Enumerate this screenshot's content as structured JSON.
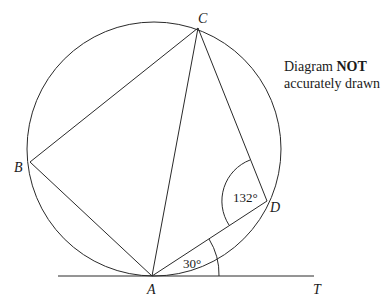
{
  "diagram": {
    "note": {
      "line1_prefix": "Diagram ",
      "line1_bold": "NOT",
      "line2": "accurately drawn"
    },
    "points": {
      "A": {
        "label": "A",
        "x": 152,
        "y": 276
      },
      "B": {
        "label": "B",
        "x": 30,
        "y": 162
      },
      "C": {
        "label": "C",
        "x": 198,
        "y": 28
      },
      "D": {
        "label": "D",
        "x": 267,
        "y": 201
      },
      "T": {
        "label": "T"
      }
    },
    "circle": {
      "cx": 154,
      "cy": 149,
      "r": 127
    },
    "tangent": {
      "label": "AT",
      "x1": 58,
      "x2": 314,
      "y": 276
    },
    "segments": [
      "AB",
      "BC",
      "CA",
      "CD",
      "DA"
    ],
    "angles": {
      "CDA": {
        "value": "132°"
      },
      "DAT": {
        "value": "30°"
      }
    },
    "colors": {
      "line": "#2a2a2a",
      "background": "#ffffff"
    }
  }
}
